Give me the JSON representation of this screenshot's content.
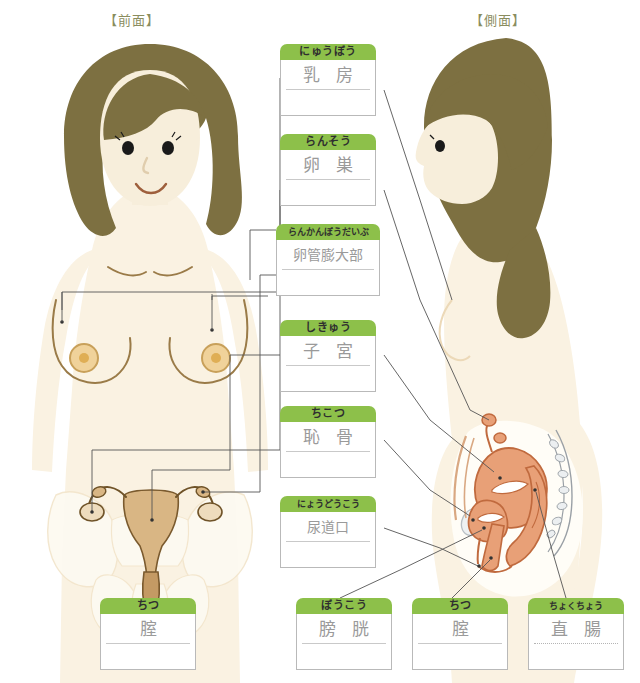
{
  "views": {
    "front_title": "【前面】",
    "side_title": "【側面】"
  },
  "colors": {
    "header_green": "#8dc04a",
    "title_text": "#8a8d5e",
    "term_text": "#9a9a9a",
    "box_border": "#b9b9b9",
    "hair": "#7d7041",
    "skin": "#f6e9d2",
    "skin_light": "#faf2e2",
    "organ_front": "#c8a06a",
    "organ_side": "#e8a077",
    "bone": "#fcf7ec",
    "nipple": "#e3b35b",
    "leader_line": "#555555"
  },
  "labels": [
    {
      "id": "nyuubou",
      "kana": "にゅうぼう",
      "term": "乳 房",
      "rule": "solid"
    },
    {
      "id": "ransou",
      "kana": "らんそう",
      "term": "卵 巣",
      "rule": "solid"
    },
    {
      "id": "rankanboudaibu",
      "kana": "らんかんぼうだいぶ",
      "term": "卵管膨大部",
      "rule": "solid"
    },
    {
      "id": "shikyuu",
      "kana": "しきゅう",
      "term": "子 宮",
      "rule": "solid"
    },
    {
      "id": "chikotsu",
      "kana": "ちこつ",
      "term": "恥 骨",
      "rule": "solid"
    },
    {
      "id": "nyoudoukou",
      "kana": "にょうどうこう",
      "term": "尿道口",
      "rule": "solid"
    },
    {
      "id": "chitsu_front",
      "kana": "ちつ",
      "term": "腟",
      "rule": "solid"
    },
    {
      "id": "boukou",
      "kana": "ぼうこう",
      "term": "膀 胱",
      "rule": "solid"
    },
    {
      "id": "chitsu_side",
      "kana": "ちつ",
      "term": "腟",
      "rule": "solid"
    },
    {
      "id": "chokuchou",
      "kana": "ちょくちょう",
      "term": "直 腸",
      "rule": "dotted"
    }
  ]
}
